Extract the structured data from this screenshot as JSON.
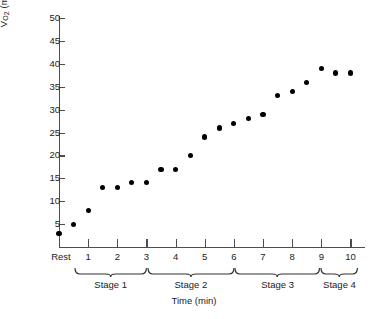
{
  "chart_data": {
    "type": "scatter",
    "title": "",
    "xlabel": "Time (min)",
    "ylabel": "VO2 (ml·kg-1·min-1)",
    "ylabel_parts": {
      "symbol": "V",
      "subscript": "O",
      "subscript2": "2",
      "units": "(ml·kg",
      "exp1": "−1",
      "mid": "·min",
      "exp2": "−1",
      "close": ")"
    },
    "ylim": [
      0,
      50
    ],
    "yticks": [
      5,
      10,
      15,
      20,
      25,
      30,
      35,
      40,
      45,
      50
    ],
    "xlim": [
      0,
      10.5
    ],
    "xticks": [
      1,
      2,
      3,
      4,
      5,
      6,
      7,
      8,
      9,
      10
    ],
    "xticklabels": [
      "1",
      "2",
      "3",
      "4",
      "5",
      "6",
      "7",
      "8",
      "9",
      "10"
    ],
    "rest_label": "Rest",
    "grid": false,
    "legend": false,
    "marker": "filled-circle",
    "marker_color": "#000000",
    "axis_color": "#4d4d4d",
    "x": [
      0.0,
      0.5,
      1.0,
      1.5,
      2.0,
      2.5,
      3.0,
      3.5,
      4.0,
      4.5,
      5.0,
      5.5,
      6.0,
      6.5,
      7.0,
      7.5,
      8.0,
      8.5,
      9.0,
      9.5,
      10.0
    ],
    "values": [
      3,
      5,
      8,
      13,
      13,
      14,
      14,
      17,
      17,
      20,
      24,
      26,
      27,
      28,
      29,
      33,
      34,
      36,
      39,
      38,
      38
    ],
    "stages": [
      {
        "label": "Stage 1",
        "start": 0.55,
        "end": 3.0
      },
      {
        "label": "Stage 2",
        "start": 3.05,
        "end": 6.0
      },
      {
        "label": "Stage 3",
        "start": 6.05,
        "end": 8.95
      },
      {
        "label": "Stage 4",
        "start": 9.0,
        "end": 10.25
      }
    ]
  },
  "caption": ""
}
